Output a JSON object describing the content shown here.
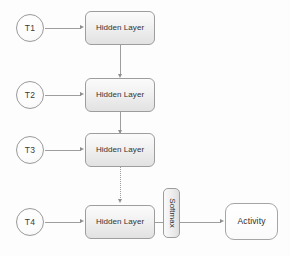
{
  "diagram": {
    "background_color": "#fdfdfd",
    "stroke_color": "#9e9e9e",
    "box_fill_color": "#eeeeee",
    "text_color": "#343434"
  },
  "time_steps": [
    {
      "id": "t1",
      "label": "T1"
    },
    {
      "id": "t2",
      "label": "T2"
    },
    {
      "id": "t3",
      "label": "T3"
    },
    {
      "id": "t4",
      "label": "T4"
    }
  ],
  "hidden_layers": [
    {
      "id": "hidden-1",
      "label": "Hidden Layer"
    },
    {
      "id": "hidden-2",
      "label": "Hidden Layer"
    },
    {
      "id": "hidden-3",
      "label": "Hidden Layer"
    },
    {
      "id": "hidden-4",
      "label": "Hidden Layer"
    }
  ],
  "softmax": {
    "label": "Softmax",
    "orientation": "vertical"
  },
  "output": {
    "label": "Activity"
  },
  "connections": [
    {
      "from": "t1",
      "to": "hidden-1",
      "style": "solid",
      "direction": "right"
    },
    {
      "from": "t2",
      "to": "hidden-2",
      "style": "solid",
      "direction": "right"
    },
    {
      "from": "t3",
      "to": "hidden-3",
      "style": "solid",
      "direction": "right"
    },
    {
      "from": "t4",
      "to": "hidden-4",
      "style": "solid",
      "direction": "right"
    },
    {
      "from": "hidden-1",
      "to": "hidden-2",
      "style": "solid",
      "direction": "down"
    },
    {
      "from": "hidden-2",
      "to": "hidden-3",
      "style": "solid",
      "direction": "down"
    },
    {
      "from": "hidden-3",
      "to": "hidden-4",
      "style": "dotted",
      "direction": "down"
    },
    {
      "from": "hidden-4",
      "to": "softmax",
      "style": "solid",
      "direction": "right"
    },
    {
      "from": "softmax",
      "to": "output",
      "style": "solid",
      "direction": "right"
    }
  ]
}
